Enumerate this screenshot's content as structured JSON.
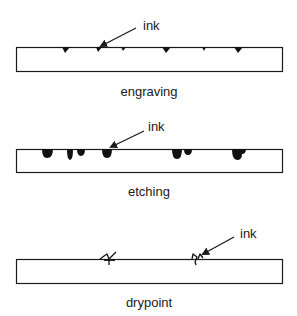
{
  "panels": [
    {
      "id": "engraving",
      "caption": "engraving",
      "pointer_label": "ink",
      "plate": {
        "x": 16,
        "y": 47,
        "w": 266,
        "h": 24
      },
      "label_pos": {
        "x": 143,
        "y": 30
      },
      "caption_pos": {
        "x": 149,
        "y": 96
      },
      "arrow": {
        "x1": 136,
        "y1": 28,
        "x2": 101,
        "y2": 46
      }
    },
    {
      "id": "etching",
      "caption": "etching",
      "pointer_label": "ink",
      "plate": {
        "x": 16,
        "y": 149,
        "w": 266,
        "h": 23
      },
      "label_pos": {
        "x": 148,
        "y": 131
      },
      "caption_pos": {
        "x": 149,
        "y": 196
      },
      "arrow": {
        "x1": 144,
        "y1": 131,
        "x2": 111,
        "y2": 147
      }
    },
    {
      "id": "drypoint",
      "caption": "drypoint",
      "pointer_label": "ink",
      "plate": {
        "x": 16,
        "y": 259,
        "w": 266,
        "h": 24
      },
      "label_pos": {
        "x": 240,
        "y": 238
      },
      "caption_pos": {
        "x": 149,
        "y": 307
      },
      "arrow": {
        "x1": 234,
        "y1": 237,
        "x2": 203,
        "y2": 254
      }
    }
  ],
  "colors": {
    "line": "#1a1a1a",
    "ink": "#111111",
    "background": "#ffffff"
  }
}
